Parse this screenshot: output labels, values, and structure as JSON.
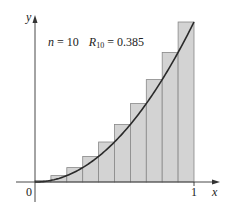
{
  "chart_data": {
    "type": "bar",
    "title": "",
    "annotation": {
      "n_label": "n = 10",
      "r_label": "R",
      "r_subscript": "10",
      "r_value": "= 0.385"
    },
    "function": "x^2",
    "n": 10,
    "method": "right endpoint",
    "categories": [
      "0.1",
      "0.2",
      "0.3",
      "0.4",
      "0.5",
      "0.6",
      "0.7",
      "0.8",
      "0.9",
      "1.0"
    ],
    "values": [
      0.01,
      0.04,
      0.09,
      0.16,
      0.25,
      0.36,
      0.49,
      0.64,
      0.81,
      1.0
    ],
    "xlabel": "x",
    "ylabel": "y",
    "x_ticks": [
      "0",
      "1"
    ],
    "xlim": [
      0,
      1.2
    ],
    "ylim": [
      0,
      1
    ],
    "grid": false,
    "legend": "none",
    "colors": {
      "bar_fill": "#d3d3d3",
      "bar_edge": "#888888",
      "curve": "#2a2a2a",
      "axis": "#333333"
    }
  }
}
